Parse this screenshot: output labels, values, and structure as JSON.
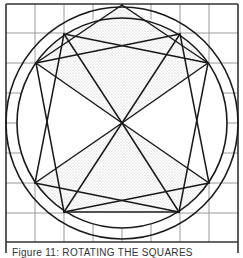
{
  "figure": {
    "type": "geometric-construction",
    "colors": {
      "background": "#ffffff",
      "stroke": "#1a1a1a",
      "grid": "#9a9a9a",
      "stipple": "#c8c8c8",
      "frame": "#333333"
    },
    "frame": {
      "x": 6,
      "y": 4,
      "width": 232,
      "height": 238
    },
    "grid": {
      "x_lines": [
        35,
        64,
        93,
        122,
        151,
        180,
        209
      ],
      "y_lines": [
        33,
        63,
        93,
        123,
        153,
        183,
        213
      ]
    },
    "center": {
      "x": 122,
      "y": 123
    },
    "circles": [
      {
        "name": "outer",
        "r": 116
      },
      {
        "name": "inner",
        "r": 105
      }
    ],
    "vertices": {
      "top": [
        122,
        5
      ],
      "upper_left": [
        64,
        34
      ],
      "upper_right": [
        180,
        34
      ],
      "left_upper": [
        36,
        63
      ],
      "right_upper": [
        208,
        63
      ],
      "left_lower": [
        35,
        183
      ],
      "right_lower": [
        209,
        183
      ],
      "lower_left": [
        64,
        212
      ],
      "lower_right": [
        179,
        212
      ]
    }
  },
  "caption": {
    "text": "Figure 11: ROTATING THE SQUARES"
  }
}
